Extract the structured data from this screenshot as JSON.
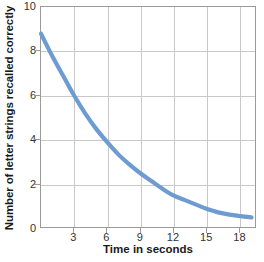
{
  "chart_data": {
    "type": "line",
    "title": "",
    "xlabel": "Time in seconds",
    "ylabel": "Number of letter strings recalled correctly",
    "xlim": [
      0,
      19.5
    ],
    "ylim": [
      0,
      10
    ],
    "xticks": [
      3,
      6,
      9,
      12,
      15,
      18
    ],
    "yticks": [
      0,
      2,
      4,
      6,
      8,
      10
    ],
    "grid": true,
    "legend": false,
    "line_color": "#6E9BD1",
    "line_width": 4,
    "series": [
      {
        "name": "Recall",
        "x": [
          0,
          1,
          2,
          3,
          4,
          5,
          6,
          7,
          8,
          9,
          10,
          11,
          12,
          13,
          14,
          15,
          16,
          17,
          18,
          19
        ],
        "y": [
          8.8,
          7.8,
          6.9,
          6.0,
          5.2,
          4.5,
          3.9,
          3.35,
          2.9,
          2.5,
          2.15,
          1.8,
          1.5,
          1.3,
          1.1,
          0.9,
          0.75,
          0.65,
          0.58,
          0.52
        ]
      }
    ]
  },
  "axes": {
    "ylabel_text": "Number of letter strings recalled correctly",
    "xlabel_text": "Time in seconds",
    "ytick_labels": [
      "0",
      "2",
      "4",
      "6",
      "8",
      "10"
    ],
    "xtick_labels": [
      "3",
      "6",
      "9",
      "12",
      "15",
      "18"
    ]
  }
}
